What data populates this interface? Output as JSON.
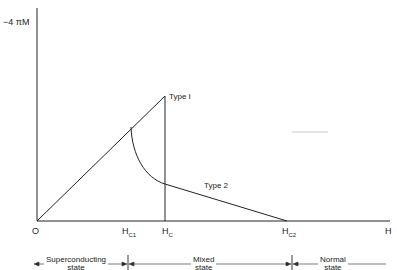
{
  "diagram": {
    "y_axis_label": "−4 πM",
    "x_axis_label": "H",
    "origin_label": "O",
    "ticks": [
      {
        "main": "H",
        "sub": "C1"
      },
      {
        "main": "H",
        "sub": "C"
      },
      {
        "main": "H",
        "sub": "C2"
      }
    ],
    "curves": [
      {
        "label": "Type I"
      },
      {
        "label": "Type 2"
      }
    ],
    "states": [
      {
        "line1": "Superconducting",
        "line2": "state"
      },
      {
        "line1": "Mixed",
        "line2": "state"
      },
      {
        "line1": "Normal",
        "line2": "state"
      }
    ],
    "colors": {
      "line": "#222222",
      "background": "#ffffff"
    }
  }
}
